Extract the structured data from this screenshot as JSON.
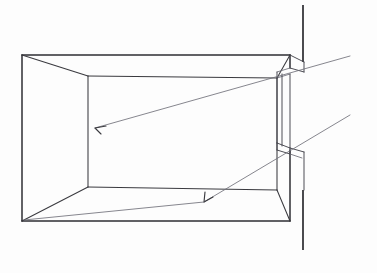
{
  "document": {
    "title": "Interior Perspective Sketch — Room with Window Opening",
    "medium": "pencil line drawing",
    "background_color": "#ffffff",
    "ink_color": "#3a3a3f",
    "ray_color": "#70707a",
    "width_px": 377,
    "height_px": 273
  },
  "scene": {
    "subject": "One-point perspective of a rectangular room interior facing a wall with a vertical window / door opening at the right",
    "annotations_count": 2,
    "ray_count": 2
  },
  "room": {
    "outer_frame": {
      "name": "near-edge-opening",
      "top_left": [
        22,
        55
      ],
      "top_right": [
        290,
        55
      ],
      "bottom_right": [
        290,
        221
      ],
      "bottom_left": [
        22,
        221
      ]
    },
    "back_wall": {
      "name": "rear-wall-rectangle",
      "top_left": [
        88,
        76
      ],
      "top_right": [
        277,
        78
      ],
      "bottom_right": [
        277,
        190
      ],
      "bottom_left": [
        88,
        187
      ]
    },
    "vanishing_edges": [
      {
        "name": "ceiling-left-diagonal",
        "from": [
          22,
          55
        ],
        "to": [
          88,
          76
        ]
      },
      {
        "name": "ceiling-right-diagonal",
        "from": [
          290,
          55
        ],
        "to": [
          277,
          78
        ]
      },
      {
        "name": "floor-left-diagonal",
        "from": [
          22,
          221
        ],
        "to": [
          88,
          187
        ]
      },
      {
        "name": "floor-right-diagonal",
        "from": [
          290,
          221
        ],
        "to": [
          277,
          190
        ]
      }
    ]
  },
  "opening": {
    "label": "window-opening-right-wall",
    "outer_wall_vertical_top": {
      "from": [
        303,
        5
      ],
      "to": [
        303,
        62
      ]
    },
    "outer_wall_vertical_bottom": {
      "from": [
        303,
        190
      ],
      "to": [
        303,
        250
      ]
    },
    "head_detail": {
      "from": [
        290,
        55
      ],
      "to": [
        303,
        62
      ]
    },
    "sill_detail": {
      "from": [
        290,
        148
      ],
      "to": [
        303,
        152
      ]
    },
    "reveal_top_y": 62,
    "reveal_bottom_y": 150,
    "jamb_depth_px": 14
  },
  "rays": [
    {
      "name": "upper-light-ray",
      "origin": [
        350,
        56
      ],
      "arrow_tip": [
        95,
        128
      ],
      "arrow_direction": "left-down-into-room",
      "target": "left wall / rear wall upper zone"
    },
    {
      "name": "lower-light-ray",
      "origin": [
        350,
        115
      ],
      "arrow_tip": [
        204,
        202
      ],
      "arrow_direction": "left-down-onto-floor",
      "target": "floor plane mid-room"
    }
  ],
  "labels": {
    "figure_caption": "",
    "axis_labels": [],
    "legend": []
  }
}
